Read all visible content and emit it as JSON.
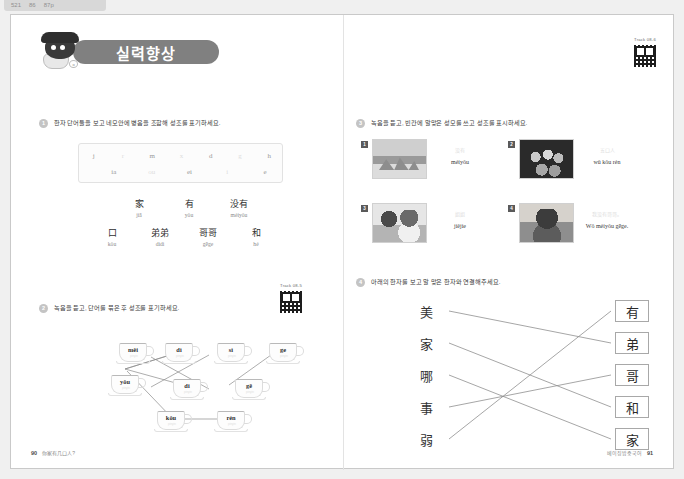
{
  "topbar": {
    "items": [
      "521",
      "86",
      "87p"
    ]
  },
  "header": {
    "banner_title": "실력향상",
    "mascot_bubble": "o"
  },
  "qr_top": {
    "label": "Track 08-6"
  },
  "qr_q2": {
    "label": "Track 08-5"
  },
  "q1": {
    "number": "1",
    "text": "한자 단어들을 보고 네모안에 병음을 조합해 성조를 표기하세요.",
    "letters_top": [
      "j",
      "r",
      "m",
      "x",
      "d",
      "g",
      "h"
    ],
    "letters_bottom": [
      "ia",
      "ou",
      "ei",
      "i",
      "e"
    ],
    "vocab_row1": [
      {
        "hanzi": "家",
        "pinyin": "jiā"
      },
      {
        "hanzi": "有",
        "pinyin": "yǒu"
      },
      {
        "hanzi": "没有",
        "pinyin": "méiyǒu"
      }
    ],
    "vocab_row2": [
      {
        "hanzi": "口",
        "pinyin": "kǒu"
      },
      {
        "hanzi": "弟弟",
        "pinyin": "dìdi"
      },
      {
        "hanzi": "哥哥",
        "pinyin": "gēge"
      },
      {
        "hanzi": "和",
        "pinyin": "hé"
      }
    ]
  },
  "q2": {
    "number": "2",
    "text": "녹음을 듣고, 단어를 묶은 후 성조를 표기하세요.",
    "cups": [
      {
        "label": "měi",
        "sub": "pinyin"
      },
      {
        "label": "dì",
        "sub": "pinyin"
      },
      {
        "label": "sì",
        "sub": "pinyin"
      },
      {
        "label": "ge",
        "sub": "pinyin"
      },
      {
        "label": "yǒu",
        "sub": "pinyin"
      },
      {
        "label": "di",
        "sub": "pinyin"
      },
      {
        "label": "gē",
        "sub": "pinyin"
      },
      {
        "label": "kǒu",
        "sub": "pinyin"
      },
      {
        "label": "rén",
        "sub": "pinyin"
      }
    ]
  },
  "q3": {
    "number": "3",
    "text": "녹음을 듣고, 빈칸에 알맞은 성모를 쓰고 성조를 표시하세요.",
    "cards": [
      {
        "badge": "1",
        "hint": "没有",
        "pinyin": "méiyǒu"
      },
      {
        "badge": "2",
        "hint": "五口人",
        "pinyin": "wǔ kǒu rén"
      },
      {
        "badge": "3",
        "hint": "姐姐",
        "pinyin": "jiějie"
      },
      {
        "badge": "4",
        "hint": "我没有哥哥。",
        "pinyin": "Wǒ méiyǒu gēge."
      }
    ]
  },
  "q4": {
    "number": "4",
    "text": "아래의 한자를 보고 알 맞은 한자와 연결해주세요.",
    "left_column": [
      "美",
      "家",
      "哪",
      "事",
      "弱"
    ],
    "right_column": [
      "有",
      "弟",
      "哥",
      "和",
      "家"
    ],
    "connections": [
      {
        "from": 0,
        "to": 1
      },
      {
        "from": 1,
        "to": 3
      },
      {
        "from": 2,
        "to": 4
      },
      {
        "from": 3,
        "to": 2
      },
      {
        "from": 4,
        "to": 0
      }
    ]
  },
  "footer_left": {
    "page": "90",
    "text": "你家有几口人?"
  },
  "footer_right": {
    "text": "베이징밥중국어",
    "page": "91"
  }
}
